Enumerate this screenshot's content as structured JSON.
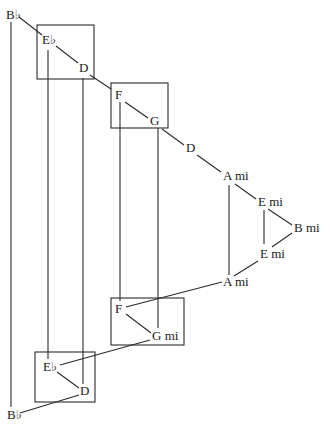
{
  "diagram": {
    "title": "",
    "nodes": [
      {
        "id": "bb_top",
        "label": "B♭",
        "x": 6,
        "y": 8
      },
      {
        "id": "eb_top",
        "label": "E♭",
        "x": 42,
        "y": 33
      },
      {
        "id": "d_top",
        "label": "D",
        "x": 79,
        "y": 61
      },
      {
        "id": "f_top",
        "label": "F",
        "x": 115,
        "y": 88
      },
      {
        "id": "g_top",
        "label": "G",
        "x": 150,
        "y": 114
      },
      {
        "id": "d_mid",
        "label": "D",
        "x": 186,
        "y": 141
      },
      {
        "id": "ami_top",
        "label": "A mi",
        "x": 223,
        "y": 169
      },
      {
        "id": "emi_top",
        "label": "E mi",
        "x": 258,
        "y": 195
      },
      {
        "id": "bmi",
        "label": "B mi",
        "x": 294,
        "y": 221
      },
      {
        "id": "emi_bot",
        "label": "E mi",
        "x": 260,
        "y": 247
      },
      {
        "id": "ami_bot",
        "label": "A mi",
        "x": 223,
        "y": 275
      },
      {
        "id": "f_bot",
        "label": "F",
        "x": 115,
        "y": 302
      },
      {
        "id": "gmi_bot",
        "label": "G mi",
        "x": 152,
        "y": 329
      },
      {
        "id": "eb_bot",
        "label": "E♭",
        "x": 43,
        "y": 360
      },
      {
        "id": "d_bot",
        "label": "D",
        "x": 80,
        "y": 384
      },
      {
        "id": "bb_bot",
        "label": "B♭",
        "x": 7,
        "y": 408
      }
    ],
    "boxes": [
      {
        "id": "box1",
        "contains": [
          "eb_top",
          "d_top"
        ],
        "x": 37,
        "y": 25,
        "w": 57,
        "h": 54
      },
      {
        "id": "box2",
        "contains": [
          "f_top",
          "g_top"
        ],
        "x": 111,
        "y": 83,
        "w": 57,
        "h": 45
      },
      {
        "id": "box3",
        "contains": [
          "f_bot",
          "gmi_bot"
        ],
        "x": 111,
        "y": 298,
        "w": 73,
        "h": 47
      },
      {
        "id": "box4",
        "contains": [
          "eb_bot",
          "d_bot"
        ],
        "x": 35,
        "y": 352,
        "w": 60,
        "h": 50
      }
    ],
    "edges": [
      {
        "from": "bb_top",
        "to": "eb_top",
        "x1": 19,
        "y1": 17,
        "x2": 42,
        "y2": 35
      },
      {
        "from": "eb_top",
        "to": "d_top",
        "x1": 56,
        "y1": 46,
        "x2": 78,
        "y2": 63
      },
      {
        "from": "d_top",
        "to": "f_top",
        "x1": 90,
        "y1": 75,
        "x2": 111,
        "y2": 89
      },
      {
        "from": "f_top",
        "to": "g_top",
        "x1": 125,
        "y1": 102,
        "x2": 148,
        "y2": 118
      },
      {
        "from": "g_top",
        "to": "d_mid",
        "x1": 162,
        "y1": 129,
        "x2": 184,
        "y2": 145
      },
      {
        "from": "d_mid",
        "to": "ami_top",
        "x1": 197,
        "y1": 155,
        "x2": 221,
        "y2": 172
      },
      {
        "from": "ami_top",
        "to": "emi_top",
        "x1": 235,
        "y1": 184,
        "x2": 256,
        "y2": 199
      },
      {
        "from": "emi_top",
        "to": "bmi",
        "x1": 268,
        "y1": 209,
        "x2": 292,
        "y2": 225
      },
      {
        "from": "bmi",
        "to": "emi_bot",
        "x1": 292,
        "y1": 233,
        "x2": 272,
        "y2": 247
      },
      {
        "from": "emi_top",
        "to": "emi_bot",
        "x1": 264,
        "y1": 210,
        "x2": 264,
        "y2": 244
      },
      {
        "from": "emi_bot",
        "to": "ami_bot",
        "x1": 258,
        "y1": 261,
        "x2": 234,
        "y2": 276
      },
      {
        "from": "ami_top",
        "to": "ami_bot",
        "x1": 229,
        "y1": 185,
        "x2": 229,
        "y2": 275
      },
      {
        "from": "ami_bot",
        "to": "f_bot",
        "x1": 222,
        "y1": 282,
        "x2": 126,
        "y2": 307
      },
      {
        "from": "f_bot",
        "to": "gmi_bot",
        "x1": 126,
        "y1": 314,
        "x2": 151,
        "y2": 333
      },
      {
        "from": "gmi_bot",
        "to": "eb_bot",
        "x1": 150,
        "y1": 340,
        "x2": 60,
        "y2": 365
      },
      {
        "from": "eb_bot",
        "to": "d_bot",
        "x1": 57,
        "y1": 372,
        "x2": 79,
        "y2": 388
      },
      {
        "from": "d_bot",
        "to": "bb_bot",
        "x1": 79,
        "y1": 395,
        "x2": 20,
        "y2": 413
      },
      {
        "from": "bb_top",
        "to": "bb_bot",
        "x1": 11,
        "y1": 22,
        "x2": 11,
        "y2": 407
      },
      {
        "from": "eb_top",
        "to": "eb_bot",
        "x1": 48,
        "y1": 50,
        "x2": 48,
        "y2": 359
      },
      {
        "from": "d_top",
        "to": "d_bot",
        "x1": 83,
        "y1": 78,
        "x2": 83,
        "y2": 384
      },
      {
        "from": "f_top",
        "to": "f_bot",
        "x1": 120,
        "y1": 102,
        "x2": 120,
        "y2": 301
      },
      {
        "from": "g_top",
        "to": "gmi_bot",
        "x1": 158,
        "y1": 128,
        "x2": 158,
        "y2": 328
      }
    ]
  }
}
